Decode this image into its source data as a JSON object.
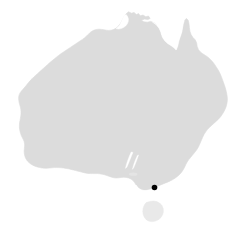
{
  "figure": {
    "kind": "locator-map",
    "title": "Australia",
    "width": 245,
    "height": 237,
    "background_color": "#ffffff"
  },
  "map": {
    "region_name": "Australia",
    "projection_note": "silhouette outline",
    "landmasses": [
      {
        "name": "mainland-australia",
        "fill_color": "#dcdcdc"
      },
      {
        "name": "tasmania",
        "fill_color": "#e9e9e9"
      },
      {
        "name": "kangaroo-island",
        "fill_color": "#e4e4e4"
      }
    ]
  },
  "markers": [
    {
      "name": "location-marker",
      "label": "",
      "color": "#000000",
      "x": 154.5,
      "y": 187.5,
      "radius": 2.8
    }
  ],
  "legend": {
    "visible": false,
    "entries": []
  },
  "axes": {
    "visible": false,
    "tick_labels": []
  },
  "annotations": []
}
